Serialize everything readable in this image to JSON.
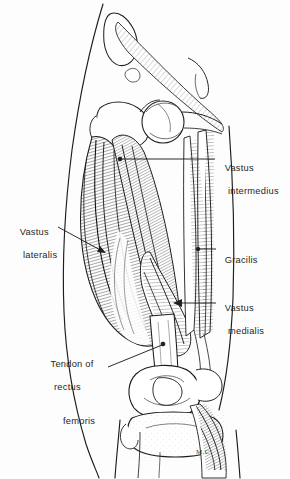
{
  "figure": {
    "type": "anatomical-line-drawing",
    "background_color": "#fdfdfd",
    "ink_color": "#262626",
    "signature": "M.C"
  },
  "labels": [
    {
      "id": "vastus-intermedius",
      "line1": "Vastus",
      "line2": "intermedius",
      "side": "right",
      "leader": {
        "style": "line-with-dot",
        "from_x": 215,
        "from_y": 159,
        "to_x": 120,
        "to_y": 159
      }
    },
    {
      "id": "vastus-lateralis",
      "line1": "Vastus",
      "line2": "lateralis",
      "side": "left",
      "leader": {
        "style": "line-with-arrow",
        "from_x": 60,
        "from_y": 228,
        "to_x": 106,
        "to_y": 253
      }
    },
    {
      "id": "gracilis",
      "line1": "Gracilis",
      "line2": "",
      "side": "right",
      "leader": {
        "style": "line-with-dot",
        "from_x": 216,
        "from_y": 249,
        "to_x": 198,
        "to_y": 249
      }
    },
    {
      "id": "vastus-medialis",
      "line1": "Vastus",
      "line2": "medialis",
      "side": "right",
      "leader": {
        "style": "line-with-arrow",
        "from_x": 216,
        "from_y": 303,
        "to_x": 174,
        "to_y": 303
      }
    },
    {
      "id": "tendon-of-rectus-femoris",
      "line1": "Tendon of",
      "line2": "rectus",
      "line3": "femoris",
      "side": "left",
      "leader": {
        "style": "line-with-dot",
        "from_x": 110,
        "from_y": 366,
        "to_x": 163,
        "to_y": 344
      }
    }
  ]
}
